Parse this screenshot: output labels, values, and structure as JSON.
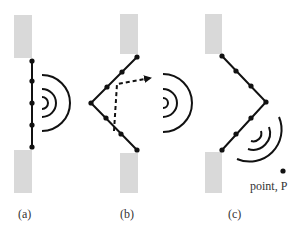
{
  "figure": {
    "panels": [
      {
        "id": "a",
        "label": "(a)",
        "shape": "flat",
        "wave": "plane-center"
      },
      {
        "id": "b",
        "label": "(b)",
        "shape": "convex-left",
        "wave": "delayed-path"
      },
      {
        "id": "c",
        "label": "(c)",
        "shape": "convex-right",
        "wave": "steered-to-point"
      }
    ],
    "point_label": "point, P",
    "colors": {
      "block": "#d9d9d9",
      "line": "#111111",
      "text": "#333333"
    }
  }
}
